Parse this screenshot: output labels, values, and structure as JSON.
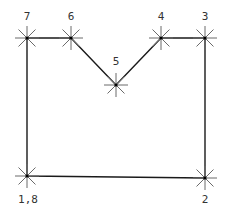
{
  "diagram": {
    "type": "polygon-with-numbered-vertices",
    "colors": {
      "background": "#ffffff",
      "edge": "#1a1a1a",
      "marker": "#6a6a6a",
      "label": "#333333"
    },
    "points": [
      {
        "id": "1,8",
        "label": "1,8",
        "x": 27,
        "y": 176,
        "label_x": 28,
        "label_y": 203
      },
      {
        "id": "2",
        "label": "2",
        "x": 205,
        "y": 178,
        "label_x": 205,
        "label_y": 203
      },
      {
        "id": "3",
        "label": "3",
        "x": 205,
        "y": 38,
        "label_x": 205,
        "label_y": 20
      },
      {
        "id": "4",
        "label": "4",
        "x": 161,
        "y": 38,
        "label_x": 161,
        "label_y": 20
      },
      {
        "id": "5",
        "label": "5",
        "x": 116,
        "y": 85,
        "label_x": 116,
        "label_y": 65
      },
      {
        "id": "6",
        "label": "6",
        "x": 71,
        "y": 38,
        "label_x": 71,
        "label_y": 20
      },
      {
        "id": "7",
        "label": "7",
        "x": 27,
        "y": 38,
        "label_x": 27,
        "label_y": 20
      }
    ],
    "path_order": [
      "1,8",
      "2",
      "3",
      "4",
      "5",
      "6",
      "7",
      "1,8"
    ]
  }
}
